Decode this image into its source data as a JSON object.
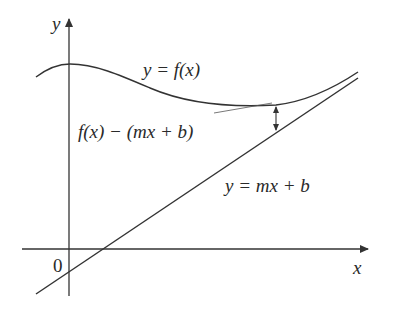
{
  "diagram": {
    "axes": {
      "x_label": "x",
      "y_label": "y",
      "origin_label": "0"
    },
    "curve": {
      "label": "y = f(x)"
    },
    "line": {
      "label": "y = mx + b"
    },
    "gap": {
      "label": "f(x) − (mx + b)"
    },
    "colors": {
      "stroke": "#333333",
      "background": "#ffffff"
    }
  }
}
